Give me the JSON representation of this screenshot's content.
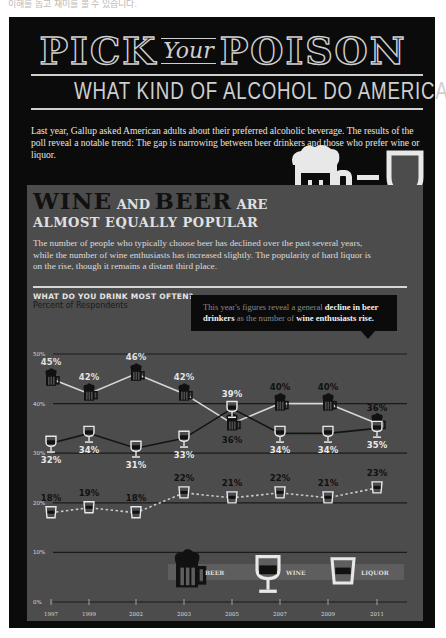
{
  "top_note": "이해를 돕고 재미를 볼 수 있습니다.",
  "header": {
    "title_left": "PICK",
    "title_mid": "Your",
    "title_right": "POISON",
    "subtitle": "WHAT KIND OF ALCOHOL DO AMERICANS PREFER?"
  },
  "intro": "Last year, Gallup asked American adults about their preferred alcoholic beverage. The results of the poll reveal a notable trend: The gap is narrowing between beer drinkers and those who prefer wine or liquor.",
  "panel": {
    "headline_wine": "WINE",
    "headline_and": " AND ",
    "headline_beer": "BEER",
    "headline_are": " ARE",
    "headline_line2": "ALMOST EQUALLY POPULAR",
    "description": "The number of people who typically choose beer has declined over the past several years, while the number of wine enthusiasts has increased slightly. The popularity of hard liquor is on the rise, though it remains a distant third place.",
    "callout_pre": "This year's figures reveal a general ",
    "callout_b1": "decline in beer drinkers",
    "callout_mid": " as the number of ",
    "callout_b2": "wine enthusiasts rise."
  },
  "colors": {
    "background": "#0b0b0b",
    "panel": "#4c4c4c",
    "light": "#e0e0e0",
    "dark": "#111111"
  },
  "chart_data": {
    "type": "line",
    "title": "WHAT DO YOU DRINK MOST OFTEN?",
    "ylabel": "Percent of Respondents",
    "xlabel": "",
    "categories": [
      "1997",
      "1999",
      "2002",
      "2003",
      "2005",
      "2007",
      "2009",
      "2011"
    ],
    "y_ticks": [
      "0%",
      "10%",
      "20%",
      "30%",
      "40%",
      "50%"
    ],
    "ylim": [
      0,
      50
    ],
    "grid": true,
    "legend_position": "bottom",
    "series": [
      {
        "name": "BEER",
        "values": [
          45,
          42,
          46,
          42,
          36,
          40,
          40,
          36
        ],
        "labels": [
          "45%",
          "42%",
          "46%",
          "42%",
          "36%",
          "40%",
          "40%",
          "36%"
        ],
        "icon": "beer-mug-icon",
        "line_color": "#d8d8d8",
        "line_style": "solid"
      },
      {
        "name": "WINE",
        "values": [
          32,
          34,
          31,
          33,
          39,
          34,
          34,
          35
        ],
        "labels": [
          "32%",
          "34%",
          "31%",
          "33%",
          "39%",
          "34%",
          "34%",
          "35%"
        ],
        "icon": "wine-glass-icon",
        "line_color": "#141414",
        "line_style": "solid"
      },
      {
        "name": "LIQUOR",
        "values": [
          18,
          19,
          18,
          22,
          21,
          22,
          21,
          23
        ],
        "labels": [
          "18%",
          "19%",
          "18%",
          "22%",
          "21%",
          "22%",
          "21%",
          "23%"
        ],
        "icon": "shot-glass-icon",
        "line_color": "#c8c8c8",
        "line_style": "dotted"
      }
    ],
    "legend": [
      "BEER",
      "WINE",
      "LIQUOR"
    ]
  }
}
